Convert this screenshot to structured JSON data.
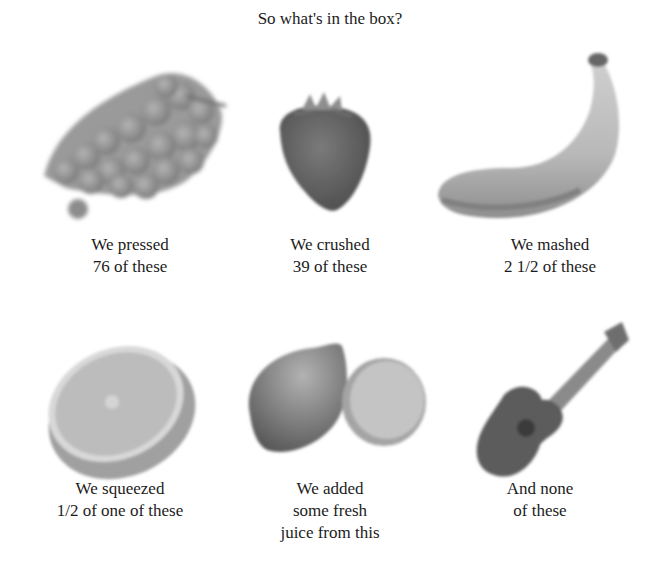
{
  "title": "So what's in the box?",
  "items": [
    {
      "name": "grapes",
      "icon": "grapes-icon",
      "caption": [
        "We pressed",
        "76 of these"
      ]
    },
    {
      "name": "strawberry",
      "icon": "strawberry-icon",
      "caption": [
        "We crushed",
        "39 of these"
      ]
    },
    {
      "name": "banana",
      "icon": "banana-icon",
      "caption": [
        "We mashed",
        "2 1/2 of these"
      ]
    },
    {
      "name": "orange",
      "icon": "orange-half-icon",
      "caption": [
        "We squeezed",
        "1/2 of one of these"
      ]
    },
    {
      "name": "lemon",
      "icon": "lemon-icon",
      "caption": [
        "We added",
        "some fresh",
        "juice from this"
      ]
    },
    {
      "name": "ukulele",
      "icon": "ukulele-icon",
      "caption": [
        "And none",
        "of these"
      ]
    }
  ]
}
